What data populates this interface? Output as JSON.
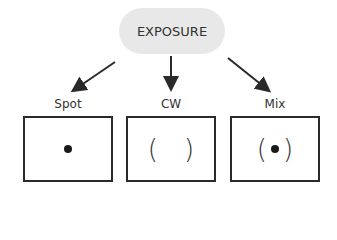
{
  "title": "EXPOSURE",
  "modes": [
    {
      "label": "Spot",
      "symbol": "dot"
    },
    {
      "label": "CW",
      "symbol": "( )"
    },
    {
      "label": "Mix",
      "symbol": "(•)"
    }
  ],
  "glyphs": {
    "open_paren": "(",
    "close_paren": ")"
  },
  "colors": {
    "pill": "#e8e8e8",
    "stroke": "#2a2a2a"
  }
}
